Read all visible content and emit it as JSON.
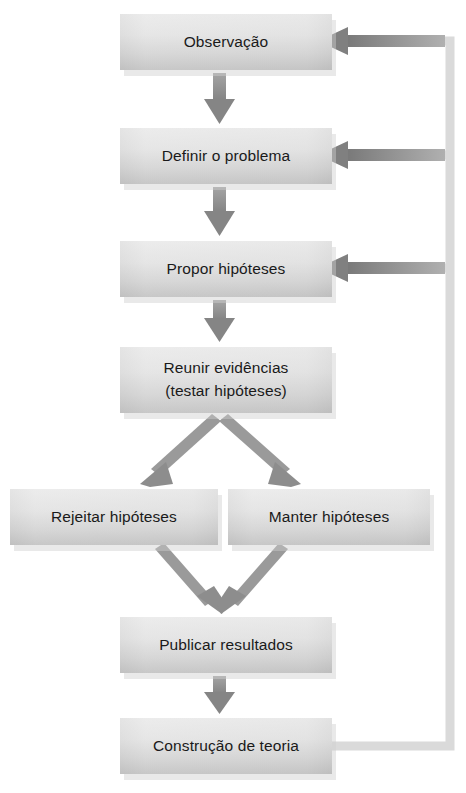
{
  "diagram": {
    "language": "pt-BR",
    "type": "flowchart",
    "background_color": "#ffffff",
    "box_fill_top": "#e6e6e6",
    "box_fill_bottom": "#b9b9b9",
    "box_text_color": "#1a1a1a",
    "arrow_color": "#8c8c8c",
    "arrow_dark_color": "#7a7a7a",
    "loop_line_color": "#d9d9d9",
    "nodes": [
      {
        "id": "observacao",
        "label": "Observação",
        "x": 120,
        "y": 14,
        "w": 212,
        "h": 56
      },
      {
        "id": "definir",
        "label": "Definir o problema",
        "x": 120,
        "y": 128,
        "w": 212,
        "h": 56
      },
      {
        "id": "hipoteses",
        "label": "Propor hipóteses",
        "x": 120,
        "y": 241,
        "w": 212,
        "h": 56
      },
      {
        "id": "evidencias",
        "label_line1": "Reunir evidências",
        "label_line2": "(testar hipóteses)",
        "x": 120,
        "y": 347,
        "w": 212,
        "h": 66
      },
      {
        "id": "rejeitar",
        "label": "Rejeitar hipóteses",
        "x": 10,
        "y": 489,
        "w": 208,
        "h": 56
      },
      {
        "id": "manter",
        "label": "Manter hipóteses",
        "x": 228,
        "y": 489,
        "w": 202,
        "h": 56
      },
      {
        "id": "publicar",
        "label": "Publicar resultados",
        "x": 120,
        "y": 617,
        "w": 212,
        "h": 56
      },
      {
        "id": "teoria",
        "label": "Construção de teoria",
        "x": 120,
        "y": 718,
        "w": 212,
        "h": 56
      }
    ],
    "edges": [
      {
        "id": "observacao-to-definir",
        "from": "observacao",
        "to": "definir",
        "kind": "down"
      },
      {
        "id": "definir-to-hipoteses",
        "from": "definir",
        "to": "hipoteses",
        "kind": "down"
      },
      {
        "id": "hipoteses-to-evidencias",
        "from": "hipoteses",
        "to": "evidencias",
        "kind": "down"
      },
      {
        "id": "evidencias-to-rejeitar",
        "from": "evidencias",
        "to": "rejeitar",
        "kind": "diagonal-left"
      },
      {
        "id": "evidencias-to-manter",
        "from": "evidencias",
        "to": "manter",
        "kind": "diagonal-right"
      },
      {
        "id": "rejeitar-to-publicar",
        "from": "rejeitar",
        "to": "publicar",
        "kind": "diagonal-right"
      },
      {
        "id": "manter-to-publicar",
        "from": "manter",
        "to": "publicar",
        "kind": "diagonal-left"
      },
      {
        "id": "publicar-to-teoria",
        "from": "publicar",
        "to": "teoria",
        "kind": "down"
      },
      {
        "id": "teoria-to-observacao",
        "from": "teoria",
        "to": "observacao",
        "kind": "feedback"
      },
      {
        "id": "teoria-to-definir",
        "from": "teoria",
        "to": "definir",
        "kind": "feedback"
      },
      {
        "id": "teoria-to-hipoteses",
        "from": "teoria",
        "to": "hipoteses",
        "kind": "feedback"
      }
    ]
  }
}
